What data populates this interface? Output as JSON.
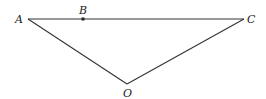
{
  "diagram": {
    "type": "geometry-triangle",
    "points": {
      "A": {
        "label": "A",
        "x": 28,
        "y": 19
      },
      "B": {
        "label": "B",
        "x": 83,
        "y": 19
      },
      "C": {
        "label": "C",
        "x": 244,
        "y": 19
      },
      "O": {
        "label": "O",
        "x": 127,
        "y": 84
      }
    },
    "segments": [
      [
        "A",
        "C"
      ],
      [
        "A",
        "O"
      ],
      [
        "O",
        "C"
      ]
    ],
    "stroke_color": "#333333"
  }
}
